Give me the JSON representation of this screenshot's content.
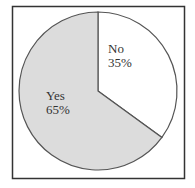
{
  "chart_data": {
    "type": "pie",
    "title": "",
    "categories": [
      "No",
      "Yes"
    ],
    "values": [
      35,
      65
    ],
    "unit": "%",
    "labels": [
      {
        "name": "No",
        "value_text": "35%"
      },
      {
        "name": "Yes",
        "value_text": "65%"
      }
    ],
    "colors": {
      "No": "#ffffff",
      "Yes": "#dcdcdc",
      "stroke": "#555555",
      "frame": "#333333"
    },
    "start_angle_deg": 0,
    "direction": "clockwise",
    "legend": "none",
    "frame": true
  }
}
